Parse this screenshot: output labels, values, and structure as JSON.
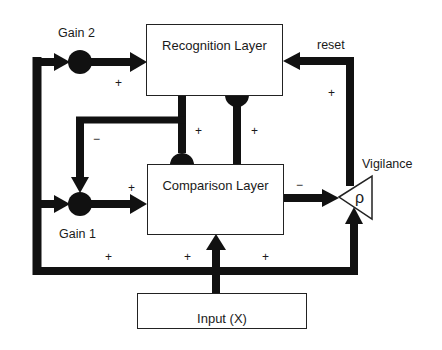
{
  "diagram": {
    "colors": {
      "line": "#111111",
      "box_border": "#222222",
      "background": "#ffffff"
    },
    "nodes": {
      "recognition_layer": {
        "label": "Recognition Layer"
      },
      "comparison_layer": {
        "label": "Comparison Layer"
      },
      "input": {
        "label": "Input (X)"
      },
      "gain2": {
        "label": "Gain 2"
      },
      "gain1": {
        "label": "Gain 1"
      },
      "vigilance": {
        "label": "Vigilance",
        "symbol": "ρ"
      }
    },
    "edge_labels": {
      "reset": "reset",
      "gain2_to_recognition": "+",
      "recognition_to_comparison": "+",
      "comparison_to_recognition": "+",
      "recognition_to_gain1": "−",
      "gain1_to_comparison": "+",
      "reset_line": "+",
      "comparison_to_vigilance": "−",
      "input_to_gain1": "+",
      "input_to_comparison": "+",
      "input_to_vigilance": "+"
    },
    "edges": [
      {
        "from": "input",
        "to": "gain2",
        "sign": ""
      },
      {
        "from": "gain2",
        "to": "recognition_layer",
        "sign": "+"
      },
      {
        "from": "input",
        "to": "gain1",
        "sign": "+"
      },
      {
        "from": "recognition_layer",
        "to": "gain1",
        "sign": "−"
      },
      {
        "from": "gain1",
        "to": "comparison_layer",
        "sign": "+"
      },
      {
        "from": "recognition_layer",
        "to": "comparison_layer",
        "sign": "+"
      },
      {
        "from": "comparison_layer",
        "to": "recognition_layer",
        "sign": "+"
      },
      {
        "from": "comparison_layer",
        "to": "vigilance",
        "sign": "−"
      },
      {
        "from": "input",
        "to": "comparison_layer",
        "sign": "+"
      },
      {
        "from": "input",
        "to": "vigilance",
        "sign": "+"
      },
      {
        "from": "vigilance",
        "to": "recognition_layer",
        "sign": "+",
        "label": "reset"
      }
    ]
  }
}
